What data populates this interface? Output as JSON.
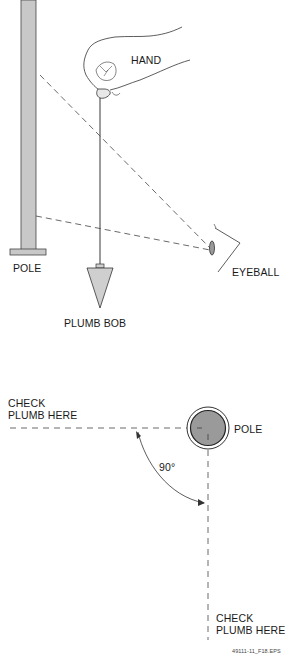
{
  "top_figure": {
    "labels": {
      "hand": "HAND",
      "pole": "POLE",
      "plumb_bob": "PLUMB BOB",
      "eyeball": "EYEBALL"
    }
  },
  "bottom_figure": {
    "labels": {
      "check_left_line1": "CHECK",
      "check_left_line2": "PLUMB HERE",
      "pole": "POLE",
      "angle": "90°",
      "check_bottom_line1": "CHECK",
      "check_bottom_line2": "PLUMB HERE"
    }
  },
  "figure_id": "49111-11_F18.EPS",
  "colors": {
    "pole_fill": "#c8c8c8",
    "bob_fill": "#cfcfcf",
    "pole_top_fill": "#9a9a9a",
    "line": "#333333"
  }
}
